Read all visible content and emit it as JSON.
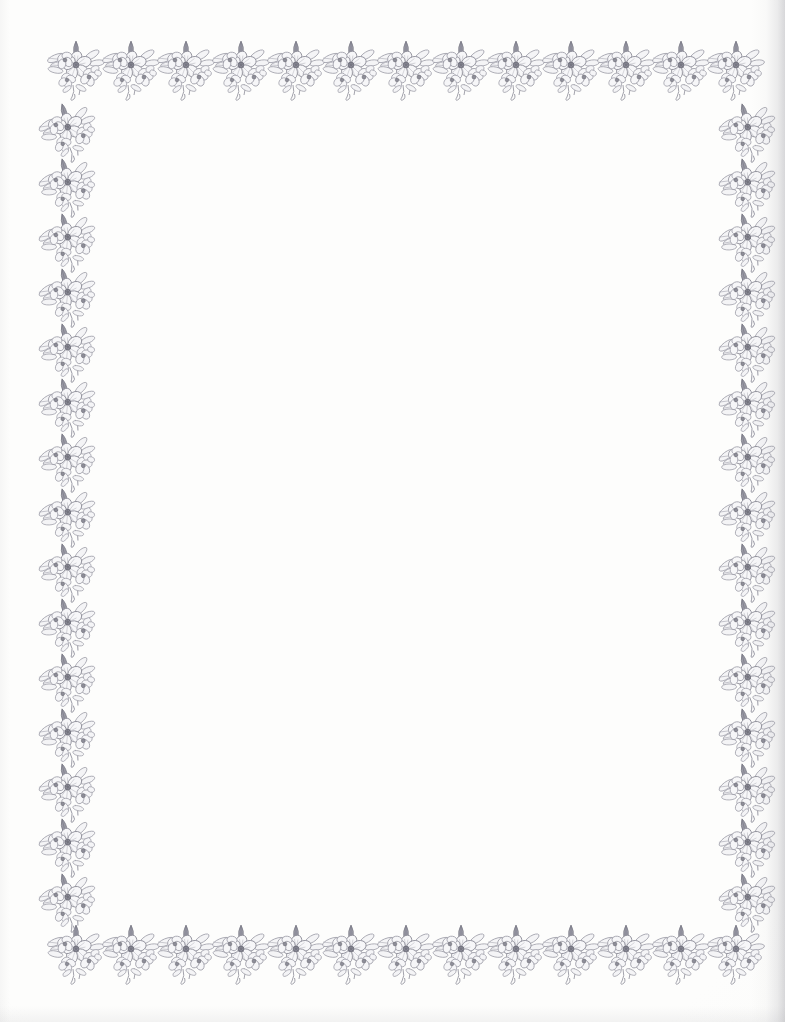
{
  "document": {
    "kind": "decorative-stationery-page",
    "title": "Floral Border Stationery Sheet",
    "page_width": 785,
    "page_height": 1022,
    "background_color": "#fdfdfc",
    "body_text": "",
    "interior_note": ""
  },
  "border": {
    "motif_name": "rose-blossom-cluster",
    "motif_description": "pencil-drawn cluster of overlapping five-petal blossoms with bud, leaves and trailing stem",
    "ink_color": "#8e8e99",
    "ink_color_light": "#aaaab4",
    "ink_color_dark": "#6f6f7c",
    "motif_width": 62,
    "motif_height": 64,
    "top": {
      "count": 13,
      "start_x": 45,
      "pitch_x": 55,
      "y": 38
    },
    "bottom": {
      "count": 13,
      "start_x": 45,
      "pitch_x": 55,
      "y": 922
    },
    "left": {
      "count": 15,
      "x": 38,
      "start_y": 100,
      "pitch_y": 55
    },
    "right": {
      "count": 15,
      "x": 718,
      "start_y": 100,
      "pitch_y": 55
    }
  },
  "artifacts": {
    "right_edge_shadow_color": "#80808a",
    "has_right_edge_shadow": true,
    "has_bottom_edge_shadow": true
  }
}
